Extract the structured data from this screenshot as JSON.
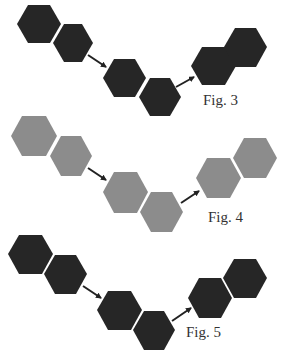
{
  "figures": [
    {
      "id": "fig3",
      "label": "Fig. 3",
      "hex_color": "#262626",
      "arrow_color": "#222222",
      "groups": [
        {
          "name": "start-pair"
        },
        {
          "name": "middle-pair"
        },
        {
          "name": "end-pair"
        }
      ]
    },
    {
      "id": "fig4",
      "label": "Fig. 4",
      "hex_color": "#8c8c8c",
      "arrow_color": "#222222",
      "groups": [
        {
          "name": "start-pair"
        },
        {
          "name": "middle-pair"
        },
        {
          "name": "end-pair"
        }
      ]
    },
    {
      "id": "fig5",
      "label": "Fig. 5",
      "hex_color": "#262626",
      "arrow_color": "#222222",
      "groups": [
        {
          "name": "start-pair"
        },
        {
          "name": "middle-pair"
        },
        {
          "name": "end-pair"
        }
      ]
    }
  ]
}
